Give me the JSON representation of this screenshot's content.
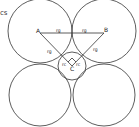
{
  "caption_fragment": "cs",
  "stroke_color": "#333333",
  "labels": {
    "A": "A",
    "B": "B",
    "C": "C",
    "rg_AB_left": "rg",
    "rg_AB_right": "rg",
    "rg_AC": "rg",
    "rg_BC": "rg",
    "rc_left": "rc",
    "rc_right": "rc"
  },
  "circles": [
    {
      "name": "circle-A",
      "cx": 40,
      "cy": 31,
      "r": 32
    },
    {
      "name": "circle-B",
      "cx": 104,
      "cy": 31,
      "r": 32
    },
    {
      "name": "circle-bottom-left",
      "cx": 40,
      "cy": 95,
      "r": 31
    },
    {
      "name": "circle-bottom-right",
      "cx": 104,
      "cy": 95,
      "r": 31
    },
    {
      "name": "circle-C",
      "cx": 72,
      "cy": 66,
      "r": 14
    }
  ]
}
